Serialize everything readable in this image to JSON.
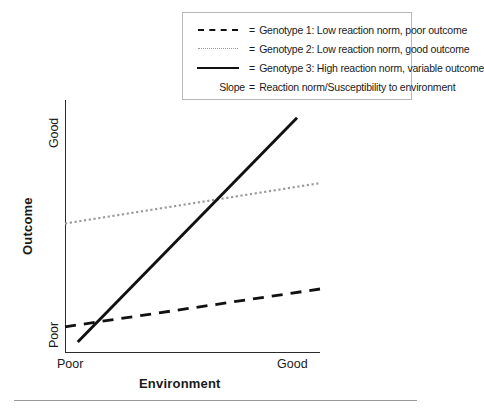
{
  "chart_data": {
    "type": "line",
    "title": "",
    "subtitle": "",
    "xlabel": "Environment",
    "ylabel": "Outcome",
    "x_tick_labels": [
      "Poor",
      "Good"
    ],
    "y_tick_labels": [
      "Poor",
      "Good"
    ],
    "xlim": [
      0,
      1
    ],
    "ylim": [
      0,
      1
    ],
    "grid": false,
    "legend_position": "top-right",
    "series": [
      {
        "name": "Genotype 1",
        "legend_label": "Genotype 1: Low reaction norm, poor outcome",
        "style": "dashed",
        "color": "#111111",
        "x": [
          0,
          1
        ],
        "y": [
          0.1,
          0.25
        ],
        "slope": "low",
        "description": "Low reaction norm, poor outcome"
      },
      {
        "name": "Genotype 2",
        "legend_label": "Genotype 2: Low reaction norm, good outcome",
        "style": "dotted",
        "color": "#9a9a9a",
        "x": [
          0,
          1
        ],
        "y": [
          0.51,
          0.67
        ],
        "slope": "low",
        "description": "Low reaction norm, good outcome"
      },
      {
        "name": "Genotype 3",
        "legend_label": "Genotype 3: High reaction norm, variable outcome",
        "style": "solid",
        "color": "#111111",
        "x": [
          0.05,
          0.91
        ],
        "y": [
          0.04,
          0.93
        ],
        "slope": "high",
        "description": "High reaction norm, variable outcome"
      }
    ],
    "annotations": [
      "Slope = Reaction norm/Susceptibility to environment"
    ]
  },
  "legend": {
    "equals": "=",
    "rows": [
      {
        "key_style": "dashed",
        "key_label": "",
        "label": "Genotype 1: Low reaction norm, poor outcome"
      },
      {
        "key_style": "dotted",
        "key_label": "",
        "label": "Genotype 2: Low reaction norm, good outcome"
      },
      {
        "key_style": "solid",
        "key_label": "",
        "label": "Genotype 3: High reaction norm, variable outcome"
      },
      {
        "key_style": "text",
        "key_label": "Slope",
        "label": "Reaction norm/Susceptibility to environment"
      }
    ]
  },
  "axes": {
    "y_title": "Outcome",
    "y_top_label": "Good",
    "y_bottom_label": "Poor",
    "x_title": "Environment",
    "x_left_label": "Poor",
    "x_right_label": "Good"
  },
  "colors": {
    "axis": "#2b2b2b",
    "genotype1": "#111111",
    "genotype2": "#9a9a9a",
    "genotype3": "#111111",
    "legend_border": "#b8b8b8",
    "footer_rule": "#9b9b9b",
    "background": "#ffffff"
  }
}
